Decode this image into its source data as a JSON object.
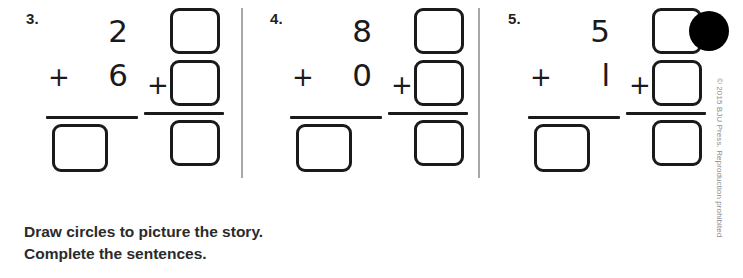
{
  "worksheet": {
    "problems": [
      {
        "number": "3.",
        "addend_top": "2",
        "plus_sign": "+",
        "addend_bottom": "6",
        "answer_box_value": "",
        "boxes": {
          "top": "",
          "bottom": "",
          "sum": "",
          "plus_sign": "+"
        }
      },
      {
        "number": "4.",
        "addend_top": "8",
        "plus_sign": "+",
        "addend_bottom": "0",
        "answer_box_value": "",
        "boxes": {
          "top": "",
          "bottom": "",
          "sum": "",
          "plus_sign": "+"
        }
      },
      {
        "number": "5.",
        "addend_top": "5",
        "plus_sign": "+",
        "addend_bottom": "l",
        "answer_box_value": "",
        "boxes": {
          "top": "",
          "bottom": "",
          "sum": "",
          "plus_sign": "+"
        }
      }
    ],
    "instructions": {
      "line1": "Draw circles to picture the story.",
      "line2": "Complete the sentences."
    },
    "copyright": "© 2015 BJU Press. Reproduction prohibited",
    "bullet_marker": "black-dot",
    "colors": {
      "ink": "#1a1a1a",
      "divider": "#a8a8a8",
      "copyright_text": "#8c8c8c",
      "instruction_text": "#2b2b2b",
      "marker": "#000000"
    }
  }
}
